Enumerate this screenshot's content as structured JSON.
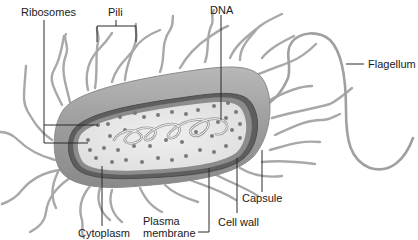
{
  "diagram": {
    "colors": {
      "capsule": "#a9a9a9",
      "capsule_dark": "#7d7d7d",
      "cell_wall": "#5e5e5e",
      "cytoplasm": "#e4e4e4",
      "ribosome": "#7a7a7a",
      "dna": "#9a9a9a",
      "appendage": "#a5a5a5",
      "leader": "#2a2a2a"
    },
    "labels": {
      "ribosomes": "Ribosomes",
      "pili": "Pili",
      "dna": "DNA",
      "flagellum": "Flagellum",
      "capsule": "Capsule",
      "cell_wall": "Cell wall",
      "plasma_membrane_line1": "Plasma",
      "plasma_membrane_line2": "membrane",
      "cytoplasm": "Cytoplasm"
    }
  }
}
